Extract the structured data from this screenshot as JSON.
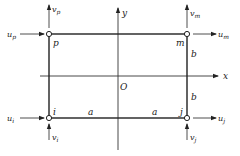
{
  "diagram": {
    "type": "rectangular-finite-element",
    "axes": {
      "x_label": "x",
      "y_label": "y",
      "origin_label": "O"
    },
    "nodes": [
      {
        "id": "p",
        "label": "p",
        "u": "u",
        "u_sub": "p",
        "v": "v",
        "v_sub": "p"
      },
      {
        "id": "m",
        "label": "m",
        "u": "u",
        "u_sub": "m",
        "v": "v",
        "v_sub": "m"
      },
      {
        "id": "i",
        "label": "i",
        "u": "u",
        "u_sub": "i",
        "v": "v",
        "v_sub": "i"
      },
      {
        "id": "j",
        "label": "j",
        "u": "u",
        "u_sub": "j",
        "v": "v",
        "v_sub": "j"
      }
    ],
    "dimensions": {
      "half_width_left": "a",
      "half_width_right": "a",
      "half_height_top": "b",
      "half_height_bottom": "b"
    }
  }
}
